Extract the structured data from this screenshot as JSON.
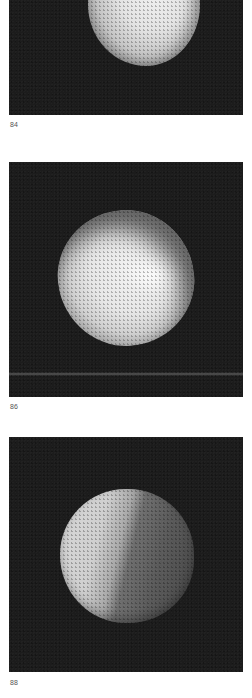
{
  "page": {
    "background": "#ffffff",
    "photo_background": "#1c1c1c"
  },
  "figures": [
    {
      "number": "84",
      "subject": "sphere lit from upper right, partially cropped at top"
    },
    {
      "number": "86",
      "subject": "sphere lit from front with soft shadow at lower left, faint horizon line"
    },
    {
      "number": "88",
      "subject": "sphere lit from left with diagonal terminator shadow"
    }
  ]
}
